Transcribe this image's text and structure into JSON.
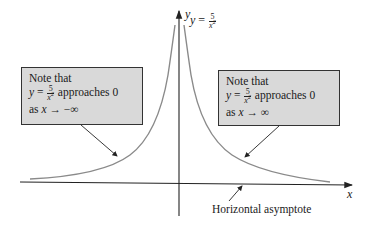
{
  "figure": {
    "axes": {
      "x_label": "x",
      "y_label": "y"
    },
    "equation": {
      "lhs": "y",
      "eq": "=",
      "numerator": "5",
      "denominator_var": "x",
      "denominator_exp": "2"
    },
    "notes": {
      "left": {
        "line1": "Note that",
        "lhs": "y",
        "eq": "=",
        "numerator": "5",
        "denominator_var": "x",
        "denominator_exp": "2",
        "tail": "approaches 0",
        "line3_prefix": "as",
        "line3_var": "x",
        "line3_arrow": "→",
        "line3_limit": "−∞"
      },
      "right": {
        "line1": "Note that",
        "lhs": "y",
        "eq": "=",
        "numerator": "5",
        "denominator_var": "x",
        "denominator_exp": "2",
        "tail": "approaches 0",
        "line3_prefix": "as",
        "line3_var": "x",
        "line3_arrow": "→",
        "line3_limit": "∞"
      }
    },
    "asymptote_label": "Horizontal asymptote",
    "colors": {
      "curve": "#8a8a8a",
      "axis": "#222222",
      "box_fill": "#d9d9d9",
      "box_border": "#333333"
    }
  }
}
